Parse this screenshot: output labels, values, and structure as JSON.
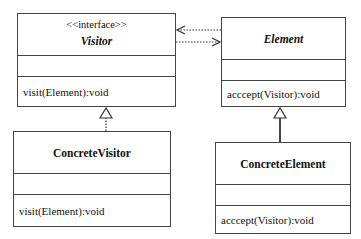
{
  "diagram": {
    "type": "uml-class-diagram",
    "classes": [
      {
        "id": "visitor",
        "stereotype": "<<interface>>",
        "name": "Visitor",
        "italic": true,
        "attributes": [],
        "operations": [
          "visit(Element):void"
        ]
      },
      {
        "id": "element",
        "stereotype": "",
        "name": "Element",
        "italic": true,
        "attributes": [],
        "operations": [
          "acccept(Visitor):void"
        ]
      },
      {
        "id": "concrete_visitor",
        "stereotype": "",
        "name": "ConcreteVisitor",
        "italic": false,
        "attributes": [],
        "operations": [
          "visit(Element):void"
        ]
      },
      {
        "id": "concrete_element",
        "stereotype": "",
        "name": "ConcreteElement",
        "italic": false,
        "attributes": [],
        "operations": [
          "acccept(Visitor):void"
        ]
      }
    ],
    "relationships": [
      {
        "from": "element",
        "to": "visitor",
        "kind": "dependency",
        "style": "dashed-open-arrow"
      },
      {
        "from": "visitor",
        "to": "element",
        "kind": "dependency",
        "style": "dashed-open-arrow"
      },
      {
        "from": "concrete_visitor",
        "to": "visitor",
        "kind": "realization",
        "style": "dashed-hollow-triangle"
      },
      {
        "from": "concrete_element",
        "to": "element",
        "kind": "generalization",
        "style": "solid-hollow-triangle"
      }
    ]
  },
  "visitor": {
    "stereotype": "<<interface>>",
    "name": "Visitor",
    "op": "visit(Element):void"
  },
  "element": {
    "name": "Element",
    "op": "acccept(Visitor):void"
  },
  "concrete_visitor": {
    "name": "ConcreteVisitor",
    "op": "visit(Element):void"
  },
  "concrete_element": {
    "name": "ConcreteElement",
    "op": "acccept(Visitor):void"
  },
  "colors": {
    "line": "#444444",
    "background": "#ffffff",
    "text": "#111111"
  }
}
